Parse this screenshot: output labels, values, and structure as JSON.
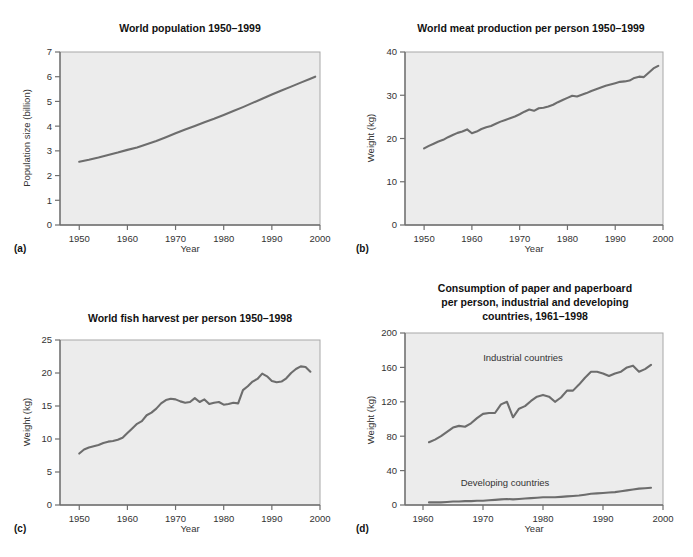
{
  "figure": {
    "background": "#ffffff",
    "plot_background": "#ececec",
    "line_color": "#6d6d6d",
    "axis_color": "#6f6f6f"
  },
  "panels": [
    {
      "key": "a",
      "label": "(a)",
      "title": "World population 1950–1999",
      "xlabel": "Year",
      "ylabel": "Population size (billion)",
      "xticks": [
        "1950",
        "1960",
        "1970",
        "1980",
        "1990",
        "2000"
      ],
      "yticks": [
        "0",
        "1",
        "2",
        "3",
        "4",
        "5",
        "6",
        "7"
      ]
    },
    {
      "key": "b",
      "label": "(b)",
      "title": "World meat production per person 1950–1999",
      "xlabel": "Year",
      "ylabel": "Weight (kg)",
      "xticks": [
        "1950",
        "1960",
        "1970",
        "1980",
        "1990",
        "2000"
      ],
      "yticks": [
        "0",
        "10",
        "20",
        "30",
        "40"
      ]
    },
    {
      "key": "c",
      "label": "(c)",
      "title": "World fish harvest per person 1950–1998",
      "xlabel": "Year",
      "ylabel": "Weight (kg)",
      "xticks": [
        "1950",
        "1960",
        "1970",
        "1980",
        "1990",
        "2000"
      ],
      "yticks": [
        "0",
        "5",
        "10",
        "15",
        "20",
        "25"
      ]
    },
    {
      "key": "d",
      "label": "(d)",
      "title_lines": [
        "Consumption of paper and paperboard",
        "per person, industrial and developing",
        "countries, 1961–1998"
      ],
      "title": "Consumption of paper and paperboard per person, industrial and developing countries, 1961–1998",
      "xlabel": "Year",
      "ylabel": "Weight (kg)",
      "xticks": [
        "1960",
        "1970",
        "1980",
        "1990",
        "2000"
      ],
      "yticks": [
        "0",
        "40",
        "80",
        "120",
        "160",
        "200"
      ],
      "annotations": [
        "Industrial countries",
        "Developing countries"
      ]
    }
  ],
  "chart_data": [
    {
      "type": "line",
      "panel": "a",
      "title": "World population 1950–1999",
      "xlabel": "Year",
      "ylabel": "Population size (billion)",
      "xlim": [
        1946,
        2000
      ],
      "ylim": [
        0,
        7
      ],
      "xticks": [
        1950,
        1960,
        1970,
        1980,
        1990,
        2000
      ],
      "yticks": [
        0,
        1,
        2,
        3,
        4,
        5,
        6,
        7
      ],
      "grid": false,
      "legend": "none",
      "series": [
        {
          "name": "World population",
          "x": [
            1950,
            1952,
            1954,
            1956,
            1958,
            1960,
            1962,
            1964,
            1966,
            1968,
            1970,
            1972,
            1974,
            1976,
            1978,
            1980,
            1982,
            1984,
            1986,
            1988,
            1990,
            1992,
            1994,
            1996,
            1998,
            1999
          ],
          "values": [
            2.56,
            2.64,
            2.73,
            2.83,
            2.93,
            3.04,
            3.14,
            3.27,
            3.4,
            3.55,
            3.71,
            3.86,
            4.01,
            4.16,
            4.3,
            4.45,
            4.61,
            4.77,
            4.94,
            5.11,
            5.28,
            5.44,
            5.6,
            5.76,
            5.92,
            6.0
          ]
        }
      ]
    },
    {
      "type": "line",
      "panel": "b",
      "title": "World meat production per person 1950–1999",
      "xlabel": "Year",
      "ylabel": "Weight (kg)",
      "xlim": [
        1946,
        2000
      ],
      "ylim": [
        0,
        40
      ],
      "xticks": [
        1950,
        1960,
        1970,
        1980,
        1990,
        2000
      ],
      "yticks": [
        0,
        10,
        20,
        30,
        40
      ],
      "grid": false,
      "legend": "none",
      "series": [
        {
          "name": "Meat production per person",
          "x": [
            1950,
            1951,
            1952,
            1953,
            1954,
            1955,
            1956,
            1957,
            1958,
            1959,
            1960,
            1961,
            1962,
            1963,
            1964,
            1965,
            1966,
            1967,
            1968,
            1969,
            1970,
            1971,
            1972,
            1973,
            1974,
            1975,
            1976,
            1977,
            1978,
            1979,
            1980,
            1981,
            1982,
            1983,
            1984,
            1985,
            1986,
            1987,
            1988,
            1989,
            1990,
            1991,
            1992,
            1993,
            1994,
            1995,
            1996,
            1997,
            1998,
            1999
          ],
          "values": [
            17.7,
            18.3,
            18.8,
            19.3,
            19.7,
            20.3,
            20.8,
            21.3,
            21.6,
            22.1,
            21.2,
            21.6,
            22.2,
            22.6,
            22.9,
            23.4,
            23.9,
            24.3,
            24.7,
            25.1,
            25.6,
            26.2,
            26.7,
            26.4,
            27.0,
            27.1,
            27.4,
            27.8,
            28.4,
            28.9,
            29.4,
            29.9,
            29.7,
            30.1,
            30.5,
            31.0,
            31.4,
            31.8,
            32.2,
            32.5,
            32.8,
            33.1,
            33.2,
            33.4,
            34.0,
            34.3,
            34.2,
            35.2,
            36.2,
            36.8
          ]
        }
      ]
    },
    {
      "type": "line",
      "panel": "c",
      "title": "World fish harvest per person 1950–1998",
      "xlabel": "Year",
      "ylabel": "Weight (kg)",
      "xlim": [
        1946,
        2000
      ],
      "ylim": [
        0,
        25
      ],
      "xticks": [
        1950,
        1960,
        1970,
        1980,
        1990,
        2000
      ],
      "yticks": [
        0,
        5,
        10,
        15,
        20,
        25
      ],
      "grid": false,
      "legend": "none",
      "series": [
        {
          "name": "Fish harvest per person",
          "x": [
            1950,
            1951,
            1952,
            1953,
            1954,
            1955,
            1956,
            1957,
            1958,
            1959,
            1960,
            1961,
            1962,
            1963,
            1964,
            1965,
            1966,
            1967,
            1968,
            1969,
            1970,
            1971,
            1972,
            1973,
            1974,
            1975,
            1976,
            1977,
            1978,
            1979,
            1980,
            1981,
            1982,
            1983,
            1984,
            1985,
            1986,
            1987,
            1988,
            1989,
            1990,
            1991,
            1992,
            1993,
            1994,
            1995,
            1996,
            1997,
            1998
          ],
          "values": [
            7.8,
            8.4,
            8.7,
            8.9,
            9.1,
            9.4,
            9.6,
            9.7,
            9.9,
            10.2,
            10.9,
            11.6,
            12.3,
            12.7,
            13.6,
            14.0,
            14.6,
            15.4,
            15.9,
            16.1,
            16.0,
            15.7,
            15.5,
            15.6,
            16.2,
            15.6,
            16.0,
            15.3,
            15.5,
            15.6,
            15.2,
            15.3,
            15.5,
            15.4,
            17.4,
            18.0,
            18.7,
            19.1,
            19.9,
            19.5,
            18.8,
            18.6,
            18.7,
            19.2,
            20.0,
            20.6,
            21.0,
            20.9,
            20.2
          ]
        }
      ]
    },
    {
      "type": "line",
      "panel": "d",
      "title": "Consumption of paper and paperboard per person, industrial and developing countries, 1961–1998",
      "xlabel": "Year",
      "ylabel": "Weight (kg)",
      "xlim": [
        1957,
        2000
      ],
      "ylim": [
        0,
        200
      ],
      "xticks": [
        1960,
        1970,
        1980,
        1990,
        2000
      ],
      "yticks": [
        0,
        40,
        80,
        120,
        160,
        200
      ],
      "grid": false,
      "legend": "annotated-inline",
      "series": [
        {
          "name": "Industrial countries",
          "x": [
            1961,
            1962,
            1963,
            1964,
            1965,
            1966,
            1967,
            1968,
            1969,
            1970,
            1971,
            1972,
            1973,
            1974,
            1975,
            1976,
            1977,
            1978,
            1979,
            1980,
            1981,
            1982,
            1983,
            1984,
            1985,
            1986,
            1987,
            1988,
            1989,
            1990,
            1991,
            1992,
            1993,
            1994,
            1995,
            1996,
            1997,
            1998
          ],
          "values": [
            73,
            76,
            80,
            85,
            90,
            92,
            91,
            95,
            101,
            106,
            107,
            107,
            117,
            120,
            102,
            112,
            115,
            121,
            126,
            128,
            126,
            120,
            125,
            133,
            133,
            140,
            148,
            155,
            155,
            153,
            150,
            153,
            155,
            160,
            162,
            155,
            158,
            163
          ]
        },
        {
          "name": "Developing countries",
          "x": [
            1961,
            1962,
            1963,
            1964,
            1965,
            1966,
            1967,
            1968,
            1969,
            1970,
            1971,
            1972,
            1973,
            1974,
            1975,
            1976,
            1977,
            1978,
            1979,
            1980,
            1981,
            1982,
            1983,
            1984,
            1985,
            1986,
            1987,
            1988,
            1989,
            1990,
            1991,
            1992,
            1993,
            1994,
            1995,
            1996,
            1997,
            1998
          ],
          "values": [
            3,
            3,
            3,
            3.5,
            4,
            4,
            4.5,
            4.5,
            5,
            5,
            5.5,
            6,
            6.5,
            7,
            6.5,
            7,
            7.5,
            8,
            8.5,
            9,
            9,
            9,
            9.5,
            10,
            10.5,
            11,
            12,
            13,
            13.5,
            14,
            14.5,
            15,
            16,
            17,
            18,
            19,
            19.5,
            20
          ]
        }
      ]
    }
  ]
}
